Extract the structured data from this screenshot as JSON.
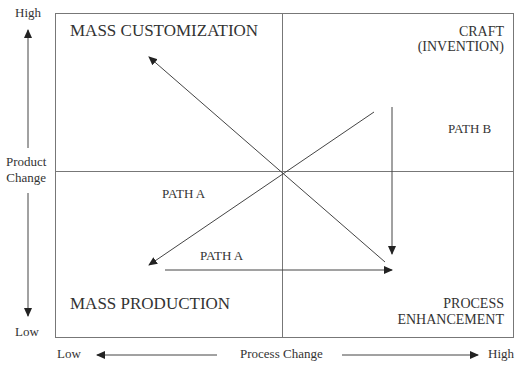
{
  "y_axis": {
    "high": "High",
    "label_line1": "Product",
    "label_line2": "Change",
    "low": "Low"
  },
  "x_axis": {
    "low": "Low",
    "label": "Process Change",
    "high": "High"
  },
  "quadrants": {
    "top_left": "MASS CUSTOMIZATION",
    "top_right_line1": "CRAFT",
    "top_right_line2": "(INVENTION)",
    "bottom_left": "MASS PRODUCTION",
    "bottom_right_line1": "PROCESS",
    "bottom_right_line2": "ENHANCEMENT"
  },
  "paths": {
    "path_a_upper": "PATH A",
    "path_a_lower": "PATH A",
    "path_b": "PATH B"
  },
  "colors": {
    "line": "#555555",
    "text": "#333333"
  }
}
